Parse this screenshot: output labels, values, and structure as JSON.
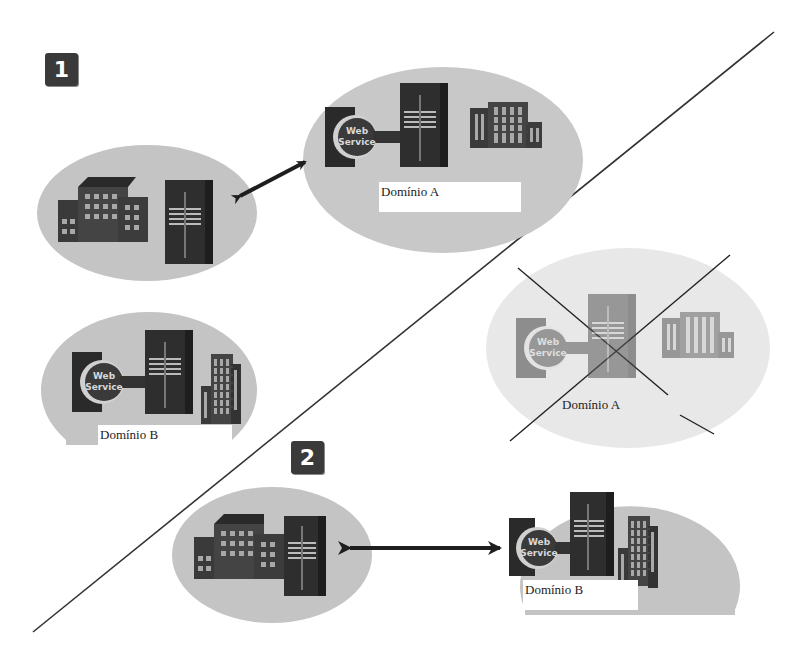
{
  "diagram": {
    "steps": [
      {
        "number": "1"
      },
      {
        "number": "2"
      }
    ],
    "domains": {
      "a": {
        "label": "Domínio A"
      },
      "a_crossed": {
        "label": "Domínio A"
      },
      "b": {
        "label": "Domínio B"
      },
      "b_step2": {
        "label": "Domínio B"
      }
    },
    "web_service": {
      "line1": "Web",
      "line2": "Service"
    },
    "colors": {
      "ellipse_fill": "#c4c4c4",
      "ellipse_faded": "#e6e6e6",
      "icon_dark": "#2e2e2e",
      "icon_mid": "#555555",
      "badge_bg": "#3a3a3a",
      "line": "#222222"
    }
  }
}
